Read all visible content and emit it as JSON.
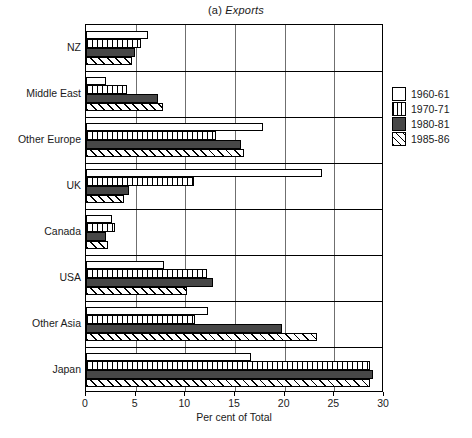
{
  "chart_data": {
    "type": "bar",
    "orientation": "horizontal",
    "title": "(a) Exports",
    "title_prefix": "(a)",
    "title_word": "Exports",
    "xlabel": "Per cent of Total",
    "ylabel": "",
    "xlim": [
      0,
      30
    ],
    "xticks": [
      0,
      5,
      10,
      15,
      20,
      25,
      30
    ],
    "xticklabels": [
      "0",
      "5",
      "10",
      "15",
      "20",
      "25",
      "30"
    ],
    "grid": true,
    "grid_axis": "x",
    "legend_position": "right",
    "categories": [
      "NZ",
      "Middle East",
      "Other Europe",
      "UK",
      "Canada",
      "USA",
      "Other Asia",
      "Japan"
    ],
    "series": [
      {
        "name": "1960-61",
        "fill": "white",
        "values": [
          6.2,
          2.0,
          17.8,
          23.8,
          2.6,
          7.9,
          12.3,
          16.6
        ]
      },
      {
        "name": "1970-71",
        "fill": "vlines",
        "values": [
          5.5,
          4.1,
          13.1,
          10.9,
          2.9,
          12.2,
          11.0,
          28.6
        ]
      },
      {
        "name": "1980-81",
        "fill": "darkgray",
        "values": [
          4.9,
          7.2,
          15.6,
          4.3,
          2.0,
          12.8,
          19.7,
          28.9
        ]
      },
      {
        "name": "1985-86",
        "fill": "diagonal",
        "values": [
          4.6,
          7.8,
          15.9,
          3.8,
          2.2,
          10.2,
          23.3,
          28.6
        ]
      }
    ]
  },
  "legend": {
    "items": [
      {
        "label": "1960-61"
      },
      {
        "label": "1970-71"
      },
      {
        "label": "1980-81"
      },
      {
        "label": "1985-86"
      }
    ]
  },
  "colors": {
    "series_1960": "#ffffff",
    "series_1980": "#474747",
    "axis": "#000000",
    "gridline": "#6f6f6f",
    "background": "#ffffff"
  }
}
